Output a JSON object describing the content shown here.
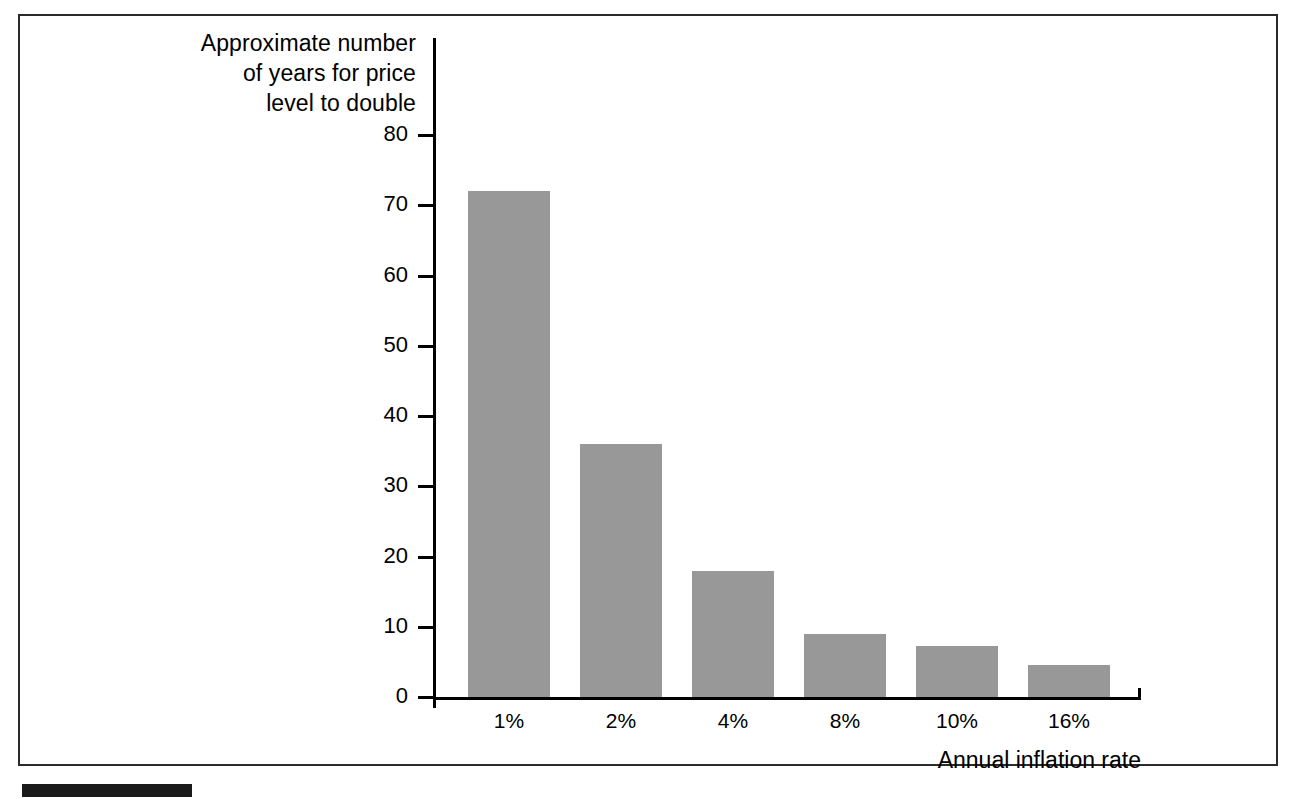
{
  "figure": {
    "background_color": "#ffffff",
    "border_color": "#2b2b2b",
    "bar_color": "#989898",
    "axis_color": "#000000"
  },
  "chart_data": {
    "type": "bar",
    "title": "",
    "categories": [
      "1%",
      "2%",
      "4%",
      "8%",
      "10%",
      "16%"
    ],
    "values": [
      72,
      36,
      18,
      9,
      7.2,
      4.5
    ],
    "xlabel": "Annual inflation rate",
    "ylabel": "Approximate number of years for price level to double",
    "ylabel_lines": [
      "Approximate number",
      "of years for price",
      "level to double"
    ],
    "ylim": [
      0,
      85
    ],
    "yticks": [
      0,
      10,
      20,
      30,
      40,
      50,
      60,
      70,
      80
    ],
    "ytick_labels": [
      "0",
      "10",
      "20",
      "30",
      "40",
      "50",
      "60",
      "70",
      "80"
    ],
    "grid": false,
    "legend": false
  }
}
